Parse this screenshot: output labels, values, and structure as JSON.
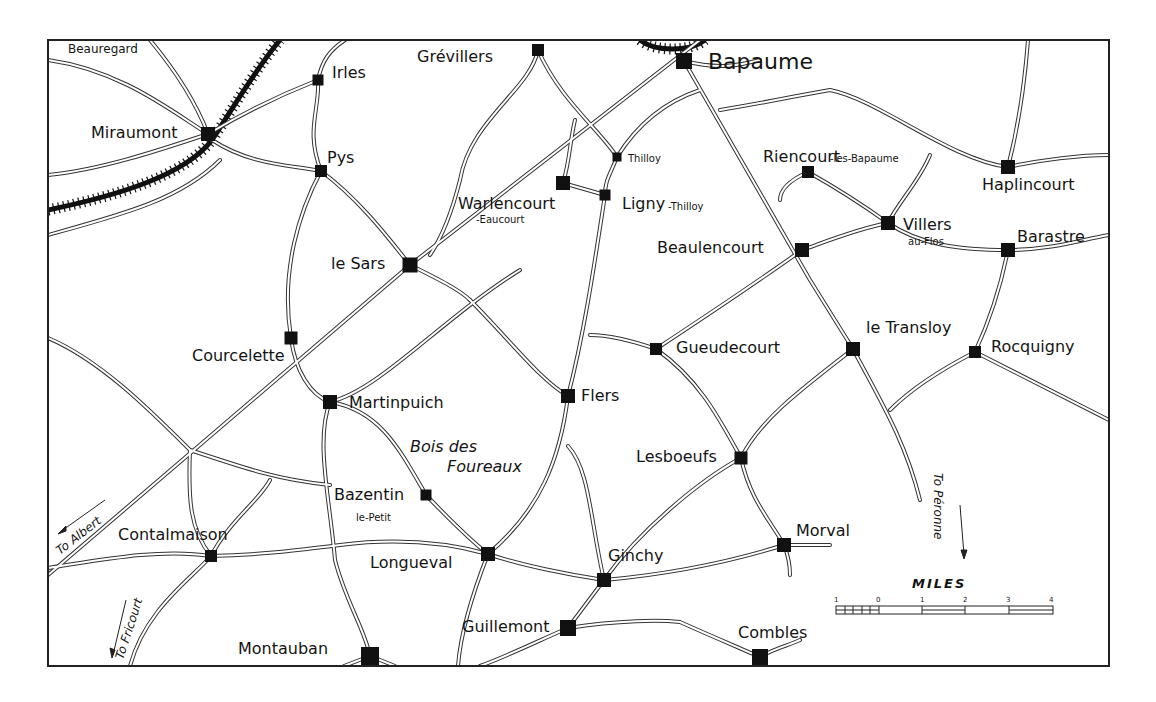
{
  "map": {
    "frame": {
      "x": 48,
      "y": 40,
      "width": 1061,
      "height": 626
    },
    "towns": [
      {
        "name": "Bapaume",
        "x": 684,
        "y": 61,
        "size": 16,
        "label_x": 708,
        "label_y": 69,
        "label_class": "xl"
      },
      {
        "name": "Grévillers",
        "x": 538,
        "y": 50,
        "size": 12,
        "label_x": 417,
        "label_y": 62,
        "label_class": "l"
      },
      {
        "name": "Irles",
        "x": 318,
        "y": 80,
        "size": 11,
        "label_x": 332,
        "label_y": 78,
        "label_class": "l"
      },
      {
        "name": "Miraumont",
        "x": 208,
        "y": 134,
        "size": 14,
        "label_x": 91,
        "label_y": 138,
        "label_class": "l"
      },
      {
        "name": "Pys",
        "x": 321,
        "y": 171,
        "size": 12,
        "label_x": 327,
        "label_y": 163,
        "label_class": "l"
      },
      {
        "name": "Thilloy",
        "x": 617,
        "y": 157,
        "size": 9,
        "label_x": 628,
        "label_y": 162,
        "label_class": "xs"
      },
      {
        "name": "Warlencourt",
        "sub": "-Eaucourt",
        "x": 563,
        "y": 183,
        "size": 14,
        "label_x": 458,
        "label_y": 209,
        "sub_x": 476,
        "sub_y": 223,
        "label_class": "l"
      },
      {
        "name": "Ligny",
        "sub": "-Thilloy",
        "x": 605,
        "y": 195,
        "size": 11,
        "label_x": 622,
        "label_y": 209,
        "sub_x": 668,
        "sub_y": 210,
        "label_class": "l"
      },
      {
        "name": "Riencourt",
        "sub": "-les-Bapaume",
        "x": 808,
        "y": 172,
        "size": 12,
        "label_x": 763,
        "label_y": 162,
        "sub_x": 830,
        "sub_y": 162,
        "label_class": "l"
      },
      {
        "name": "Haplincourt",
        "x": 1008,
        "y": 167,
        "size": 14,
        "label_x": 982,
        "label_y": 190,
        "label_class": "l"
      },
      {
        "name": "Villers",
        "sub": "au-Flos",
        "x": 888,
        "y": 223,
        "size": 14,
        "label_x": 903,
        "label_y": 230,
        "sub_x": 908,
        "sub_y": 245,
        "label_class": "l"
      },
      {
        "name": "Barastre",
        "x": 1008,
        "y": 250,
        "size": 14,
        "label_x": 1017,
        "label_y": 242,
        "label_class": "l"
      },
      {
        "name": "Beaulencourt",
        "x": 802,
        "y": 250,
        "size": 14,
        "label_x": 657,
        "label_y": 253,
        "label_class": "l"
      },
      {
        "name": "le Sars",
        "x": 410,
        "y": 265,
        "size": 15,
        "label_x": 331,
        "label_y": 269,
        "label_class": "l"
      },
      {
        "name": "Courcelette",
        "x": 291,
        "y": 338,
        "size": 13,
        "label_x": 192,
        "label_y": 361,
        "label_class": "l"
      },
      {
        "name": "Gueudecourt",
        "x": 656,
        "y": 349,
        "size": 12,
        "label_x": 676,
        "label_y": 353,
        "label_class": "l"
      },
      {
        "name": "le Transloy",
        "x": 853,
        "y": 349,
        "size": 14,
        "label_x": 866,
        "label_y": 333,
        "label_class": "l"
      },
      {
        "name": "Rocquigny",
        "x": 975,
        "y": 352,
        "size": 12,
        "label_x": 991,
        "label_y": 352,
        "label_class": "l"
      },
      {
        "name": "Martinpuich",
        "x": 330,
        "y": 402,
        "size": 14,
        "label_x": 349,
        "label_y": 408,
        "label_class": "l"
      },
      {
        "name": "Flers",
        "x": 568,
        "y": 396,
        "size": 14,
        "label_x": 581,
        "label_y": 401,
        "label_class": "l"
      },
      {
        "name": "Lesboeufs",
        "x": 741,
        "y": 458,
        "size": 13,
        "label_x": 636,
        "label_y": 462,
        "label_class": "l"
      },
      {
        "name": "Bazentin",
        "sub": "le-Petit",
        "x": 426,
        "y": 495,
        "size": 11,
        "label_x": 334,
        "label_y": 500,
        "sub_x": 356,
        "sub_y": 521,
        "label_class": "l"
      },
      {
        "name": "Contalmaison",
        "x": 211,
        "y": 556,
        "size": 12,
        "label_x": 118,
        "label_y": 540,
        "label_class": "l"
      },
      {
        "name": "Longueval",
        "x": 488,
        "y": 554,
        "size": 14,
        "label_x": 370,
        "label_y": 568,
        "label_class": "l"
      },
      {
        "name": "Ginchy",
        "x": 604,
        "y": 580,
        "size": 14,
        "label_x": 608,
        "label_y": 561,
        "label_class": "l"
      },
      {
        "name": "Morval",
        "x": 784,
        "y": 545,
        "size": 14,
        "label_x": 796,
        "label_y": 536,
        "label_class": "l"
      },
      {
        "name": "Guillemont",
        "x": 568,
        "y": 628,
        "size": 16,
        "label_x": 462,
        "label_y": 632,
        "label_class": "l"
      },
      {
        "name": "Combles",
        "x": 760,
        "y": 657,
        "size": 16,
        "label_x": 738,
        "label_y": 638,
        "label_class": "l"
      },
      {
        "name": "Montauban",
        "x": 370,
        "y": 656,
        "size": 18,
        "label_x": 238,
        "label_y": 654,
        "label_class": "l"
      }
    ],
    "annotations": [
      {
        "name": "beauregard-label",
        "text": "Beauregard",
        "x": 68,
        "y": 53,
        "class": "s"
      },
      {
        "name": "bois-des-foureaux-label-1",
        "text": "Bois des",
        "x": 410,
        "y": 452,
        "class": "it"
      },
      {
        "name": "bois-des-foureaux-label-2",
        "text": "Foureaux",
        "x": 447,
        "y": 472,
        "class": "it"
      },
      {
        "name": "to-albert-label",
        "text": "To Albert",
        "x": 60,
        "y": 555,
        "rotate": -38,
        "class": "it"
      },
      {
        "name": "to-fricourt-label",
        "text": "To Fricourt",
        "x": 123,
        "y": 660,
        "rotate": -72,
        "class": "it"
      },
      {
        "name": "to-peronne-label",
        "text": "To Péronne",
        "x": 934,
        "y": 473,
        "rotate": 90,
        "class": "it"
      }
    ],
    "scale": {
      "title": "MILES",
      "ticks": [
        "1",
        "0",
        "1",
        "2",
        "3",
        "4"
      ]
    }
  }
}
